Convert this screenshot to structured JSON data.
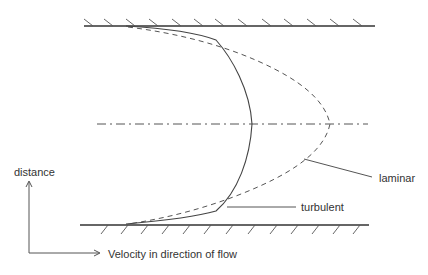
{
  "diagram": {
    "labels": {
      "laminar": "laminar",
      "turbulent": "turbulent",
      "y_axis": "distance",
      "x_axis": "Velocity in direction of flow"
    },
    "elements": {
      "top_wall": "fixed boundary (top)",
      "bottom_wall": "fixed boundary (bottom)",
      "centerline": "pipe centerline (dash-dot)",
      "laminar_profile": "parabolic velocity profile (dashed)",
      "turbulent_profile": "flattened velocity profile (solid)"
    },
    "colors": {
      "line": "#333333",
      "background": "#ffffff"
    }
  }
}
